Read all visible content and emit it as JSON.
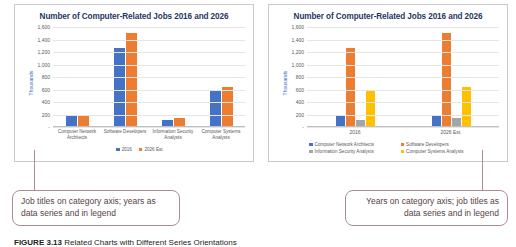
{
  "figure": {
    "caption_label": "FIGURE 3.13",
    "caption_text": "Related Charts with Different Series Orientations"
  },
  "colors": {
    "blue": "#4472C4",
    "orange": "#ED7D31",
    "gray": "#A5A5A5",
    "yellow": "#FFC000",
    "title": "#1F3864",
    "callout_border": "#B08A92",
    "callout_text": "#5A3F46",
    "gridline": "#E6E6E6",
    "tick_text": "#595959"
  },
  "left_chart": {
    "title": "Number of Computer-Related Jobs 2016 and 2026",
    "y_axis_label": "Thousands",
    "y_ticks": [
      "1,600",
      "1,400",
      "1,200",
      "1,000",
      "800",
      "600",
      "400",
      "200",
      "-"
    ],
    "categories": [
      "Computer Network Architects",
      "Software Developers",
      "Information Security Analysts",
      "Computer Systems Analysts"
    ],
    "legend": [
      "2016",
      "2026 Est."
    ]
  },
  "right_chart": {
    "title": "Number of Computer-Related Jobs 2016 and 2026",
    "y_axis_label": "Thousands",
    "y_ticks": [
      "1,600",
      "1,400",
      "1,200",
      "1,000",
      "800",
      "600",
      "400",
      "200",
      "-"
    ],
    "categories": [
      "2016",
      "2026 Est."
    ],
    "legend": [
      "Computer Network Architects",
      "Software Developers",
      "Information Security Analysts",
      "Computer Systems Analysts"
    ]
  },
  "callouts": {
    "left": "Job titles on category axis; years as data series and in legend",
    "right": "Years on category axis; job titles as data series and in legend"
  },
  "chart_data": [
    {
      "type": "bar",
      "title": "Number of Computer-Related Jobs 2016 and 2026",
      "xlabel": "",
      "ylabel": "Thousands",
      "ylim": [
        0,
        1600
      ],
      "ytick_step": 200,
      "grid": true,
      "legend_position": "bottom",
      "categories": [
        "Computer Network Architects",
        "Software Developers",
        "Information Security Analysts",
        "Computer Systems Analysts"
      ],
      "series": [
        {
          "name": "2016",
          "color": "#4472C4",
          "values": [
            162,
            1256,
            100,
            583
          ]
        },
        {
          "name": "2026 Est.",
          "color": "#ED7D31",
          "values": [
            173,
            1511,
            128,
            637
          ]
        }
      ]
    },
    {
      "type": "bar",
      "title": "Number of Computer-Related Jobs 2016 and 2026",
      "xlabel": "",
      "ylabel": "Thousands",
      "ylim": [
        0,
        1600
      ],
      "ytick_step": 200,
      "grid": true,
      "legend_position": "bottom",
      "categories": [
        "2016",
        "2026 Est."
      ],
      "series": [
        {
          "name": "Computer Network Architects",
          "color": "#4472C4",
          "values": [
            162,
            173
          ]
        },
        {
          "name": "Software Developers",
          "color": "#ED7D31",
          "values": [
            1256,
            1511
          ]
        },
        {
          "name": "Information Security Analysts",
          "color": "#A5A5A5",
          "values": [
            100,
            128
          ]
        },
        {
          "name": "Computer Systems Analysts",
          "color": "#FFC000",
          "values": [
            583,
            637
          ]
        }
      ]
    }
  ]
}
